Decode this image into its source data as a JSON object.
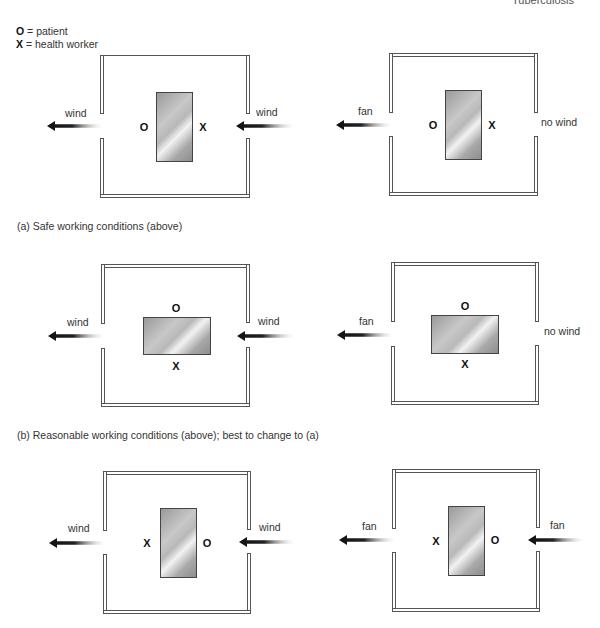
{
  "header": {
    "title": "Tuberculosis"
  },
  "legend": {
    "patient_symbol": "O",
    "patient_text": " = patient",
    "worker_symbol": "X",
    "worker_text": " = health worker"
  },
  "captions": {
    "a": "(a) Safe working conditions (above)",
    "b": "(b) Reasonable working conditions (above); best to change to (a)"
  },
  "rooms": [
    {
      "id": "a-left",
      "left_label": "wind",
      "right_label": "wind",
      "left_mark": "O",
      "right_mark": "X",
      "bed": "vertical"
    },
    {
      "id": "a-right",
      "left_label": "fan",
      "right_label": "no wind",
      "left_mark": "O",
      "right_mark": "X",
      "bed": "vertical"
    },
    {
      "id": "b-left",
      "left_label": "wind",
      "right_label": "wind",
      "top_mark": "O",
      "bottom_mark": "X",
      "bed": "horizontal"
    },
    {
      "id": "b-right",
      "left_label": "fan",
      "right_label": "no wind",
      "top_mark": "O",
      "bottom_mark": "X",
      "bed": "horizontal"
    },
    {
      "id": "c-left",
      "left_label": "wind",
      "right_label": "wind",
      "left_mark": "X",
      "right_mark": "O",
      "bed": "vertical"
    },
    {
      "id": "c-right",
      "left_label": "fan",
      "right_label": "fan",
      "left_mark": "X",
      "right_mark": "O",
      "bed": "vertical"
    }
  ],
  "colors": {
    "wall": "#555555",
    "arrow": "#111111",
    "bed_dark": "#8e8e8e",
    "bed_light": "#f2f2f2"
  }
}
